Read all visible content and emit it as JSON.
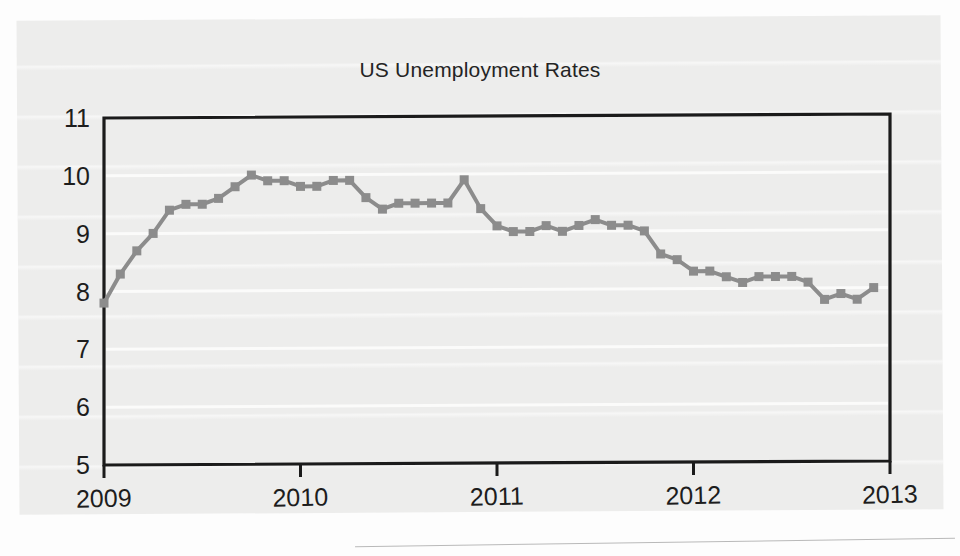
{
  "figure": {
    "title": "US Unemployment Rates"
  },
  "chart_data": {
    "type": "line",
    "title": "US Unemployment Rates",
    "xlabel": "",
    "ylabel": "",
    "xlim": [
      2009,
      2013
    ],
    "ylim": [
      5,
      11
    ],
    "xtick_labels": [
      "2009",
      "2010",
      "2011",
      "2012",
      "2013"
    ],
    "xticks": [
      2009,
      2010,
      2011,
      2012,
      2013
    ],
    "ytick_labels": [
      "5",
      "6",
      "7",
      "8",
      "9",
      "10",
      "11"
    ],
    "yticks": [
      5,
      6,
      7,
      8,
      9,
      10,
      11
    ],
    "grid": "horizontal-white-faint",
    "legend": "none",
    "marker": "square",
    "line_color": "#8c8c8c",
    "series": [
      {
        "name": "US Unemployment Rate",
        "x": [
          2009.0,
          2009.083,
          2009.167,
          2009.25,
          2009.333,
          2009.417,
          2009.5,
          2009.583,
          2009.667,
          2009.75,
          2009.833,
          2009.917,
          2010.0,
          2010.083,
          2010.167,
          2010.25,
          2010.333,
          2010.417,
          2010.5,
          2010.583,
          2010.667,
          2010.75,
          2010.833,
          2010.917,
          2011.0,
          2011.083,
          2011.167,
          2011.25,
          2011.333,
          2011.417,
          2011.5,
          2011.583,
          2011.667,
          2011.75,
          2011.833,
          2011.917,
          2012.0,
          2012.083,
          2012.167,
          2012.25,
          2012.333,
          2012.417,
          2012.5,
          2012.583,
          2012.667,
          2012.75,
          2012.833,
          2012.917
        ],
        "values": [
          7.8,
          8.3,
          8.7,
          9.0,
          9.4,
          9.5,
          9.5,
          9.6,
          9.8,
          10.0,
          9.9,
          9.9,
          9.8,
          9.8,
          9.9,
          9.9,
          9.6,
          9.4,
          9.5,
          9.5,
          9.5,
          9.5,
          9.9,
          9.4,
          9.1,
          9.0,
          9.0,
          9.1,
          9.0,
          9.1,
          9.2,
          9.1,
          9.1,
          9.0,
          8.6,
          8.5,
          8.3,
          8.3,
          8.2,
          8.1,
          8.2,
          8.2,
          8.2,
          8.1,
          7.8,
          7.9,
          7.8,
          8.0
        ]
      }
    ]
  }
}
